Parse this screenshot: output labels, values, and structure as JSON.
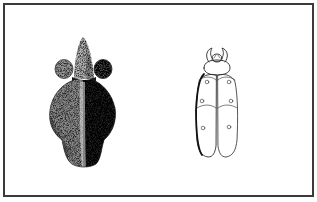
{
  "plate": {
    "border_color": "#3a3a3a",
    "background_color": "#ffffff"
  },
  "figures": [
    {
      "id": "stippled-figurine",
      "description": "Stippled drawing of a carved figurine with pointed top, two round side knobs and a broad lobed body",
      "style": "stipple",
      "light_tone": "#bdbdbd",
      "dark_tone": "#1e1e1e"
    },
    {
      "id": "beetle-outline",
      "description": "Line drawing of a beetle-shaped object seen from above, with head, pronotum and two elytra marked with small circles",
      "style": "line",
      "stroke_color": "#2a2a2a",
      "dot_count": 6
    }
  ]
}
